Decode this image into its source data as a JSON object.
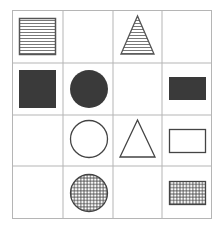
{
  "puzzle": {
    "title": "",
    "rows": 4,
    "cols": 4,
    "grid_line_color": "#b5b5b5",
    "shape_stroke_color": "#444444",
    "fill_color": "#3a3a3a",
    "cells": [
      [
        {
          "shape": "square",
          "fill": "horizontal-stripes"
        },
        {
          "shape": "empty",
          "fill": "none"
        },
        {
          "shape": "triangle",
          "fill": "horizontal-stripes"
        },
        {
          "shape": "empty",
          "fill": "none"
        }
      ],
      [
        {
          "shape": "square",
          "fill": "solid"
        },
        {
          "shape": "circle",
          "fill": "solid"
        },
        {
          "shape": "empty",
          "fill": "none"
        },
        {
          "shape": "rectangle",
          "fill": "solid"
        }
      ],
      [
        {
          "shape": "empty",
          "fill": "none"
        },
        {
          "shape": "circle",
          "fill": "outline"
        },
        {
          "shape": "triangle",
          "fill": "outline"
        },
        {
          "shape": "rectangle",
          "fill": "outline"
        }
      ],
      [
        {
          "shape": "empty",
          "fill": "none"
        },
        {
          "shape": "circle",
          "fill": "crosshatch"
        },
        {
          "shape": "empty",
          "fill": "none"
        },
        {
          "shape": "rectangle",
          "fill": "crosshatch"
        }
      ]
    ]
  }
}
